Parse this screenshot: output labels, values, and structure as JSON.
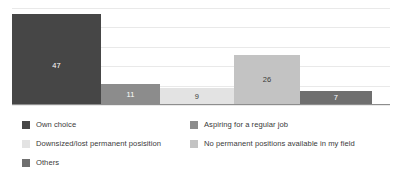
{
  "chart_data": {
    "type": "bar",
    "title": "",
    "subtitle": "",
    "xlabel": "",
    "ylabel": "",
    "ylim": [
      0,
      50
    ],
    "grid": true,
    "gridline_values": [
      0,
      10,
      20,
      30,
      40,
      50
    ],
    "legend_position": "bottom",
    "orientation": "vertical",
    "categories": [
      "Own choice",
      "Aspiring for a regular job",
      "Downsized/lost permanent posisition",
      "No permanent positions available in my field",
      "Others"
    ],
    "values": [
      47,
      11,
      9,
      26,
      7
    ],
    "data_labels": [
      "47",
      "11",
      "9",
      "26",
      "7"
    ],
    "colors": [
      "#464646",
      "#8c8c8c",
      "#e3e3e3",
      "#c3c3c3",
      "#6f6f6f"
    ],
    "label_text_colors": [
      "#ffffff",
      "#ffffff",
      "#3c3c3c",
      "#3c3c3c",
      "#ffffff"
    ],
    "bar_widths": [
      89,
      59,
      74,
      66,
      72
    ],
    "bar_x": [
      0,
      89,
      148,
      222,
      288
    ],
    "axis_color": "#8d8d8d",
    "gridline_color": "#e9e9e9",
    "background": "#ffffff"
  },
  "legend": {
    "columns": [
      {
        "name": "legend-column-left",
        "items": [
          {
            "label": "Own choice",
            "color": "#464646"
          },
          {
            "label": "Downsized/lost permanent posisition",
            "color": "#e3e3e3"
          },
          {
            "label": "Others",
            "color": "#6f6f6f"
          }
        ]
      },
      {
        "name": "legend-column-right",
        "items": [
          {
            "label": "Aspiring for a regular job",
            "color": "#8c8c8c"
          },
          {
            "label": "No permanent positions available in my field",
            "color": "#c3c3c3"
          }
        ]
      }
    ]
  }
}
